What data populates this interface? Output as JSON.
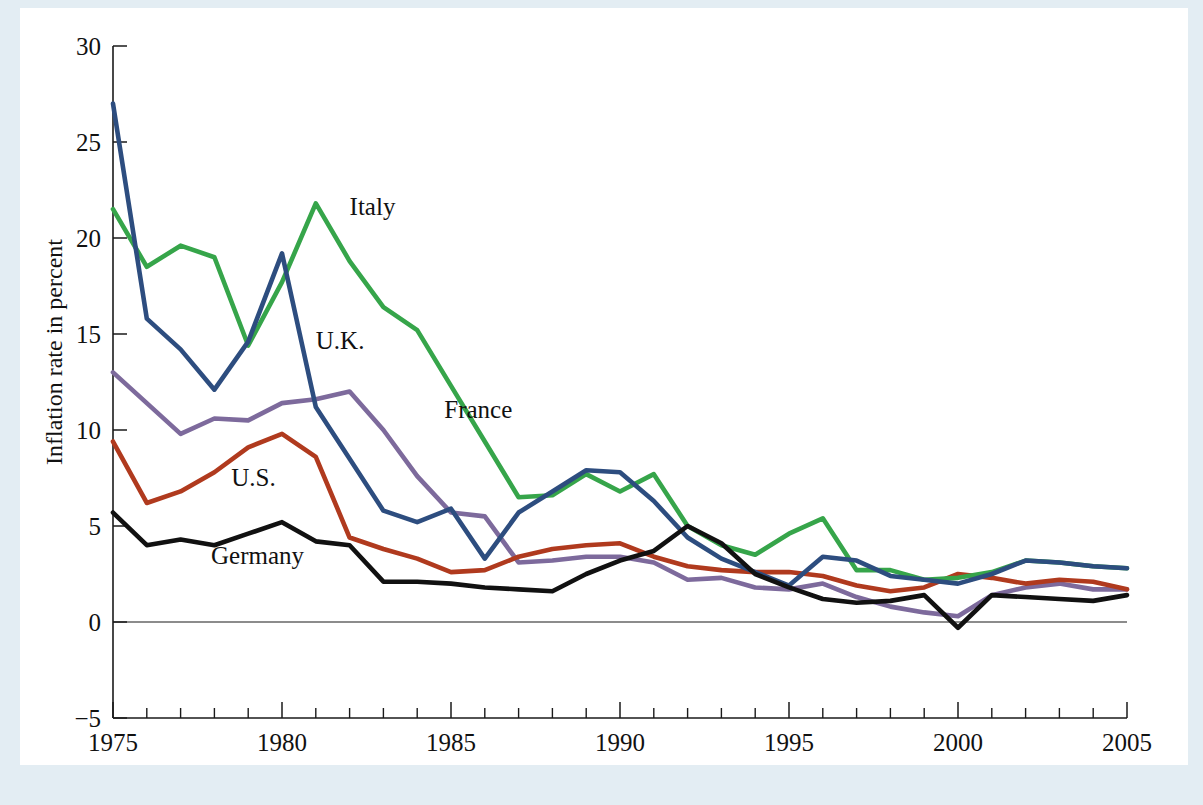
{
  "figure": {
    "background_color": "#e3edf3",
    "plate_color": "#ffffff"
  },
  "chart_data": {
    "type": "line",
    "title": "",
    "subtitle": "",
    "xlabel": "",
    "ylabel": "Inflation rate in percent",
    "xlim": [
      1975,
      2005
    ],
    "ylim": [
      -5,
      30
    ],
    "grid": false,
    "legend_position": "inline-labels",
    "y_ticks": [
      -5,
      0,
      5,
      10,
      15,
      20,
      25,
      30
    ],
    "y_tick_labels": [
      "−5",
      "0",
      "5",
      "10",
      "15",
      "20",
      "25",
      "30"
    ],
    "x_ticks": [
      1975,
      1980,
      1985,
      1990,
      1995,
      2000,
      2005
    ],
    "x_tick_labels": [
      "1975",
      "1980",
      "1985",
      "1990",
      "1995",
      "2000",
      "2005"
    ],
    "x_minor_tick_step": 1,
    "x": [
      1975,
      1976,
      1977,
      1978,
      1979,
      1980,
      1981,
      1982,
      1983,
      1984,
      1985,
      1986,
      1987,
      1988,
      1989,
      1990,
      1991,
      1992,
      1993,
      1994,
      1995,
      1996,
      1997,
      1998,
      1999,
      2000,
      2001,
      2002,
      2003,
      2004,
      2005
    ],
    "series": [
      {
        "name": "U.K.",
        "color": "#2d4d7f",
        "label": "U.K.",
        "label_x": 1981.0,
        "label_y": 14.2,
        "values": [
          27.0,
          15.8,
          14.2,
          12.1,
          14.6,
          19.2,
          11.2,
          8.5,
          5.8,
          5.2,
          5.9,
          3.3,
          5.7,
          6.8,
          7.9,
          7.8,
          6.3,
          4.4,
          3.3,
          2.6,
          1.9,
          3.4,
          3.2,
          2.4,
          2.2,
          2.0,
          2.5,
          3.2,
          3.1,
          2.9,
          2.8
        ]
      },
      {
        "name": "Italy",
        "color": "#36a54a",
        "label": "Italy",
        "label_x": 1982.0,
        "label_y": 21.2,
        "values": [
          21.5,
          18.5,
          19.6,
          19.0,
          14.4,
          17.7,
          21.8,
          18.8,
          16.4,
          15.2,
          12.3,
          9.4,
          6.5,
          6.6,
          7.7,
          6.8,
          7.7,
          5.0,
          4.0,
          3.5,
          4.6,
          5.4,
          2.7,
          2.7,
          2.2,
          2.3,
          2.6,
          3.2,
          3.1,
          2.9,
          2.8
        ]
      },
      {
        "name": "France",
        "color": "#7d6a9c",
        "label": "France",
        "label_x": 1984.8,
        "label_y": 10.6,
        "values": [
          13.0,
          11.4,
          9.8,
          10.6,
          10.5,
          11.4,
          11.6,
          12.0,
          10.0,
          7.6,
          5.7,
          5.5,
          3.1,
          3.2,
          3.4,
          3.4,
          3.1,
          2.2,
          2.3,
          1.8,
          1.7,
          2.0,
          1.3,
          0.8,
          0.5,
          0.3,
          1.4,
          1.8,
          2.0,
          1.7,
          1.7
        ]
      },
      {
        "name": "U.S.",
        "color": "#b03a1e",
        "label": "U.S.",
        "label_x": 1978.5,
        "label_y": 7.1,
        "values": [
          9.4,
          6.2,
          6.8,
          7.8,
          9.1,
          9.8,
          8.6,
          4.4,
          3.8,
          3.3,
          2.6,
          2.7,
          3.4,
          3.8,
          4.0,
          4.1,
          3.4,
          2.9,
          2.7,
          2.6,
          2.6,
          2.4,
          1.9,
          1.6,
          1.8,
          2.5,
          2.3,
          2.0,
          2.2,
          2.1,
          1.7
        ]
      },
      {
        "name": "Germany",
        "color": "#111111",
        "label": "Germany",
        "label_x": 1977.9,
        "label_y": 3.0,
        "values": [
          5.7,
          4.0,
          4.3,
          4.0,
          4.6,
          5.2,
          4.2,
          4.0,
          2.1,
          2.1,
          2.0,
          1.8,
          1.7,
          1.6,
          2.5,
          3.2,
          3.7,
          5.0,
          4.1,
          2.5,
          1.8,
          1.2,
          1.0,
          1.1,
          1.4,
          -0.3,
          1.4,
          1.3,
          1.2,
          1.1,
          1.4
        ]
      }
    ]
  }
}
